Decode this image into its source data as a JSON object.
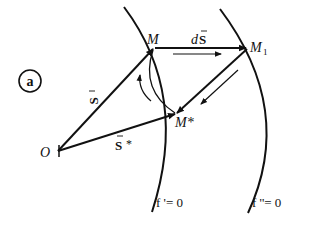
{
  "figure": {
    "panel_label": "a",
    "points": {
      "origin": "O",
      "m": "M",
      "m1": "M",
      "m1_sub": "1",
      "m_star": "M*"
    },
    "vectors": {
      "s": "S",
      "s_star": "S",
      "s_star_suffix": "*",
      "ds_prefix": "d",
      "ds": "S"
    },
    "surfaces": {
      "f_prime": "f '= 0",
      "f_double_prime": "f ''= 0"
    },
    "colors": {
      "stroke": "#111111",
      "background": "#ffffff"
    }
  }
}
